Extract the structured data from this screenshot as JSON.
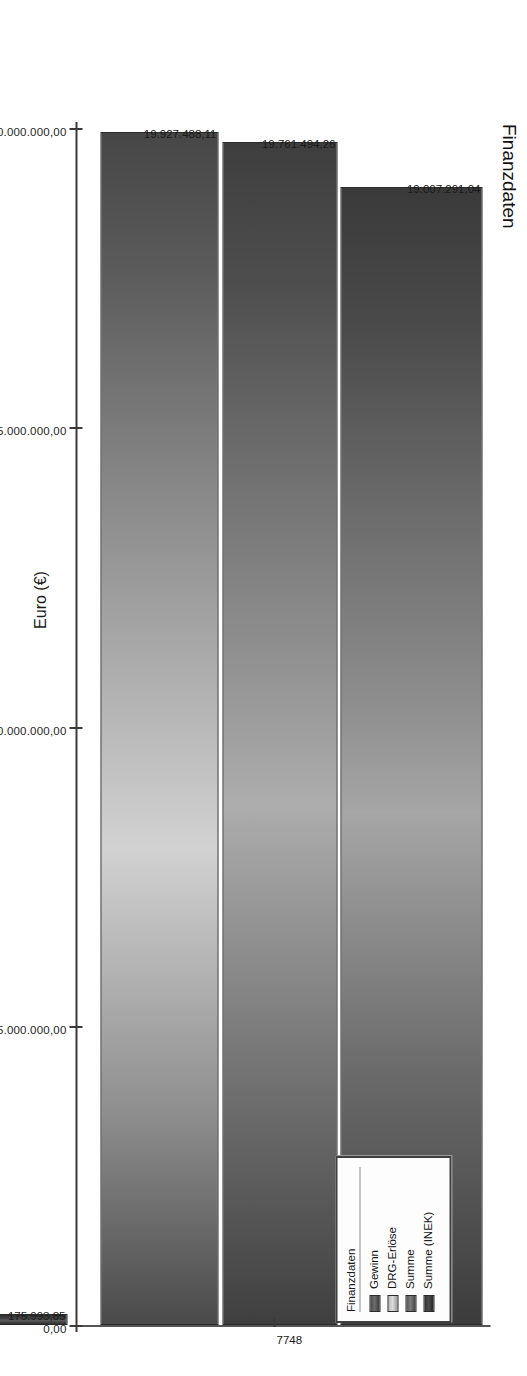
{
  "chart_data": {
    "type": "bar",
    "orientation": "horizontal",
    "title": "Finanzdaten",
    "xlabel": "Fallzahl",
    "ylabel": "Euro (€)",
    "categories": [
      "7748"
    ],
    "category_tick_label": "7748",
    "ylim": [
      0,
      20000000
    ],
    "grid": false,
    "legend_position": "top-right",
    "legend_title": "Finanzdaten",
    "series": [
      {
        "name": "Gewinn",
        "value": 175993.85,
        "value_label": "175.993,85",
        "color": "#5a5a5a"
      },
      {
        "name": "DRG-Erlöse",
        "value": 19927488.11,
        "value_label": "19.927.488,11",
        "color": "#c3c3c3"
      },
      {
        "name": "Summe",
        "value": 19761494.26,
        "value_label": "19.761.494,26",
        "color": "#7c7c7c"
      },
      {
        "name": "Summe (INEK)",
        "value": 19007291.04,
        "value_label": "19.007.291,04",
        "color": "#3a3a3a"
      }
    ],
    "tick_labels": [
      "20.000.000,00",
      "15.000.000,00",
      "10.000.000,00",
      "5.000.000,00",
      "0,00"
    ],
    "tick_values": [
      20000000,
      15000000,
      10000000,
      5000000,
      0
    ]
  },
  "legend": {
    "title": "Finanzdaten",
    "items": [
      {
        "label": "Gewinn"
      },
      {
        "label": "DRG-Erlöse"
      },
      {
        "label": "Summe"
      },
      {
        "label": "Summe (INEK)"
      }
    ]
  }
}
